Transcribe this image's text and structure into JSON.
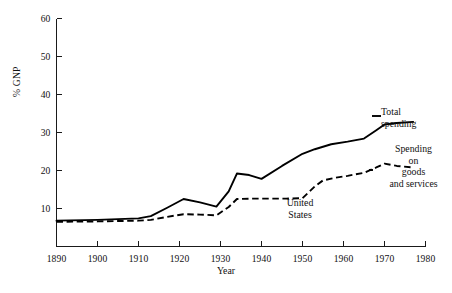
{
  "chart_data": {
    "type": "line",
    "title": "",
    "xlabel": "Year",
    "ylabel": "% GNP",
    "xlim": [
      1890,
      1980
    ],
    "ylim": [
      0,
      60
    ],
    "grid": false,
    "legend_position": "right-inline-annotations",
    "xticks": [
      1890,
      1900,
      1910,
      1920,
      1930,
      1940,
      1950,
      1960,
      1970,
      1980
    ],
    "xtick_labels": [
      "1890",
      "1900",
      "1910",
      "1920",
      "1930",
      "1940",
      "1950",
      "1960",
      "1970",
      "1980"
    ],
    "yticks": [
      10,
      20,
      30,
      40,
      50,
      60
    ],
    "ytick_labels": [
      "10",
      "20",
      "30",
      "40",
      "50",
      "60"
    ],
    "annotations": [
      {
        "name": "total-spending",
        "text": "Total\nspending"
      },
      {
        "name": "goods-and-services",
        "text": "Spending\non\ngoods\nand services"
      },
      {
        "name": "country",
        "text": "United\nStates"
      }
    ],
    "series": [
      {
        "name": "Total spending",
        "style": "solid",
        "color": "#000000",
        "x": [
          1890,
          1900,
          1910,
          1913,
          1917,
          1921,
          1925,
          1929,
          1932,
          1934,
          1937,
          1940,
          1945,
          1950,
          1953,
          1957,
          1961,
          1965,
          1968,
          1970,
          1973,
          1977
        ],
        "values": [
          6.8,
          7.0,
          7.4,
          8.0,
          10.2,
          12.5,
          11.6,
          10.5,
          14.5,
          19.2,
          18.8,
          17.8,
          21.2,
          24.4,
          25.6,
          26.9,
          27.6,
          28.4,
          30.6,
          32.1,
          32.5,
          32.8
        ]
      },
      {
        "name": "Spending on goods and services",
        "style": "dashed",
        "color": "#000000",
        "x": [
          1890,
          1900,
          1910,
          1913,
          1917,
          1921,
          1925,
          1929,
          1932,
          1934,
          1938,
          1942,
          1946,
          1950,
          1953,
          1955,
          1958,
          1961,
          1965,
          1968,
          1970,
          1973,
          1977
        ],
        "values": [
          6.5,
          6.6,
          6.8,
          7.0,
          7.8,
          8.5,
          8.4,
          8.2,
          10.4,
          12.5,
          12.6,
          12.6,
          12.6,
          12.7,
          15.8,
          17.4,
          18.1,
          18.6,
          19.4,
          20.8,
          21.8,
          21.2,
          20.8
        ]
      }
    ]
  },
  "axes": {
    "x_axis_name": "year-axis",
    "y_axis_name": "gnp-axis"
  }
}
